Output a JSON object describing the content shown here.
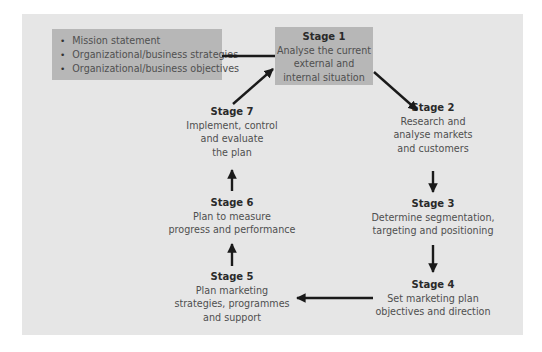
{
  "diagram": {
    "inputs": {
      "items": [
        "Mission statement",
        "Organizational/business strategies",
        "Organizational/business objectives"
      ]
    },
    "stages": [
      {
        "title": "Stage 1",
        "lines": [
          "Analyse the current",
          "external and",
          "internal situation"
        ]
      },
      {
        "title": "Stage 2",
        "lines": [
          "Research and",
          "analyse markets",
          "and customers"
        ]
      },
      {
        "title": "Stage 3",
        "lines": [
          "Determine segmentation,",
          "targeting and positioning"
        ]
      },
      {
        "title": "Stage 4",
        "lines": [
          "Set marketing plan",
          "objectives and direction"
        ]
      },
      {
        "title": "Stage 5",
        "lines": [
          "Plan marketing",
          "strategies, programmes",
          "and support"
        ]
      },
      {
        "title": "Stage 6",
        "lines": [
          "Plan to measure",
          "progress and performance"
        ]
      },
      {
        "title": "Stage 7",
        "lines": [
          "Implement, control",
          "and evaluate",
          "the plan"
        ]
      }
    ],
    "flow": [
      "inputs -> Stage 1",
      "Stage 1 -> Stage 2",
      "Stage 2 -> Stage 3",
      "Stage 3 -> Stage 4",
      "Stage 4 -> Stage 5",
      "Stage 5 -> Stage 6",
      "Stage 6 -> Stage 7",
      "Stage 7 -> Stage 1"
    ],
    "colors": {
      "panel": "#e6e6e6",
      "box": "#b7b7b7",
      "arrow": "#1a1a1a",
      "title": "#2a2a2a",
      "text": "#555555"
    }
  }
}
